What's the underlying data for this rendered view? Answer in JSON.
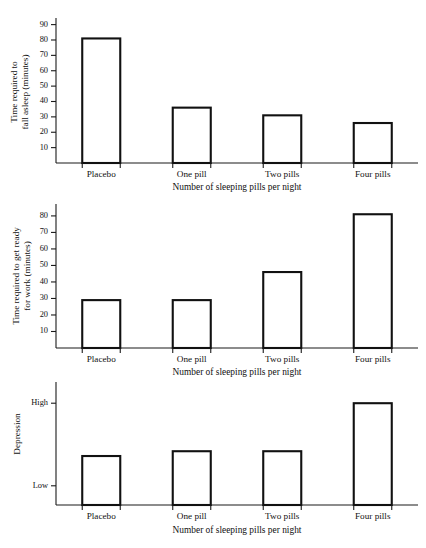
{
  "chart_data": [
    {
      "id": "chart-1",
      "type": "bar",
      "title": "",
      "categories": [
        "Placebo",
        "One pill",
        "Two pills",
        "Four pills"
      ],
      "values": [
        81,
        36,
        31,
        26
      ],
      "xlabel": "Number of sleeping pills per night",
      "ylabel_lines": [
        "Time required to",
        "fall asleep (minutes)"
      ],
      "yticks": [
        10,
        20,
        30,
        40,
        50,
        60,
        70,
        80,
        90
      ],
      "yticklabels": [
        "10",
        "20",
        "30",
        "40",
        "50",
        "60",
        "70",
        "80",
        "90"
      ],
      "ylim": [
        0,
        93
      ],
      "grid": false,
      "legend": "none"
    },
    {
      "id": "chart-2",
      "type": "bar",
      "title": "",
      "categories": [
        "Placebo",
        "One pill",
        "Two pills",
        "Four pills"
      ],
      "values": [
        29,
        29,
        46,
        81
      ],
      "xlabel": "Number of sleeping pills per night",
      "ylabel_lines": [
        "Time required to get ready",
        "for work (minutes)"
      ],
      "yticks": [
        10,
        20,
        30,
        40,
        50,
        60,
        70,
        80
      ],
      "yticklabels": [
        "10",
        "20",
        "30",
        "40",
        "50",
        "60",
        "70",
        "80"
      ],
      "ylim": [
        0,
        86
      ],
      "grid": false,
      "legend": "none"
    },
    {
      "id": "chart-3",
      "type": "bar",
      "title": "",
      "categories": [
        "Placebo",
        "One pill",
        "Two pills",
        "Four pills"
      ],
      "values": [
        2.55,
        2.8,
        2.8,
        5.3
      ],
      "value_labels": [
        "medium-low",
        "medium",
        "medium",
        "high"
      ],
      "xlabel": "Number of sleeping pills per night",
      "ylabel_lines": [
        "Depression"
      ],
      "yticks": [
        1,
        5.3
      ],
      "yticklabels": [
        "Low",
        "High"
      ],
      "ylim": [
        0,
        6.3
      ],
      "grid": false,
      "legend": "none"
    }
  ]
}
